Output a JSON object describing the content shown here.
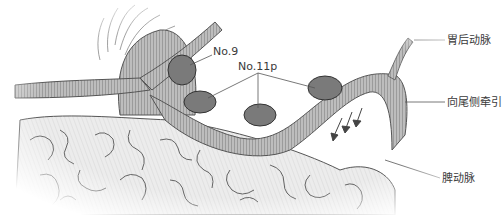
{
  "diagram": {
    "type": "anatomical-illustration",
    "labels": {
      "no9": "No.9",
      "no11p": "No.11p",
      "left_gastric_posterior_artery": "胃后动脉",
      "caudal_traction": "向尾侧牵引",
      "splenic_artery": "脾动脉"
    },
    "structures": [
      {
        "name": "pancreas",
        "description": "lobulated gland tissue filling lower portion"
      },
      {
        "name": "splenic-artery",
        "description": "ribbed tubular vessel curving across pancreas"
      },
      {
        "name": "celiac-trunk",
        "description": "branching vessel on upper-left with radiating fibers"
      },
      {
        "name": "posterior-gastric-artery",
        "description": "thin vessel branching upward to the right"
      },
      {
        "name": "lymph-nodes",
        "count": 4,
        "groups": [
          "No.9",
          "No.11p"
        ]
      }
    ],
    "arrows": {
      "count": 3,
      "direction": "down-left",
      "meaning": "caudal traction"
    },
    "colors": {
      "node_fill": "#7a7a7a",
      "vessel_fill": "#b5b5b5",
      "line": "#555555",
      "tissue_fill": "#e6e6e6"
    }
  }
}
